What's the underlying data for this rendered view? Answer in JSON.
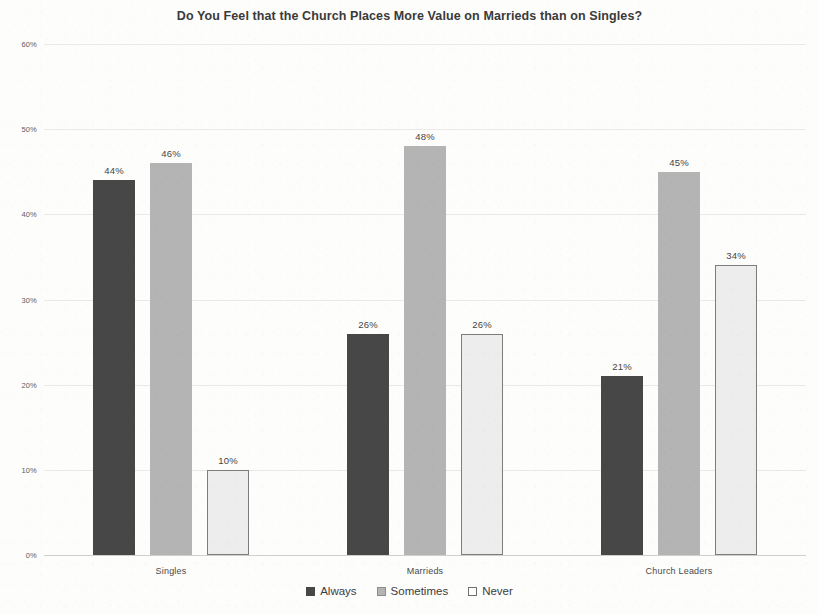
{
  "chart_data": {
    "type": "bar",
    "title": "Do You Feel that the Church Places More Value on Marrieds than on Singles?",
    "xlabel": "",
    "ylabel": "",
    "categories": [
      "Singles",
      "Marrieds",
      "Church Leaders"
    ],
    "series": [
      {
        "name": "Always",
        "color": "#474747",
        "values": [
          44,
          26,
          21
        ],
        "labels": [
          "44%",
          "26%",
          "21%"
        ]
      },
      {
        "name": "Sometimes",
        "color": "#b4b4b4",
        "values": [
          46,
          48,
          45
        ],
        "labels": [
          "46%",
          "48%",
          "45%"
        ]
      },
      {
        "name": "Never",
        "color": "#ededed",
        "values": [
          10,
          26,
          34
        ],
        "labels": [
          "10%",
          "26%",
          "34%"
        ]
      }
    ],
    "ylim": [
      0,
      60
    ],
    "ytick_values": [
      0,
      10,
      20,
      30,
      40,
      50,
      60
    ],
    "ytick_labels": [
      "0%",
      "10%",
      "20%",
      "30%",
      "40%",
      "50%",
      "60%"
    ],
    "grid": true,
    "legend_position": "bottom",
    "value_labels": true
  }
}
